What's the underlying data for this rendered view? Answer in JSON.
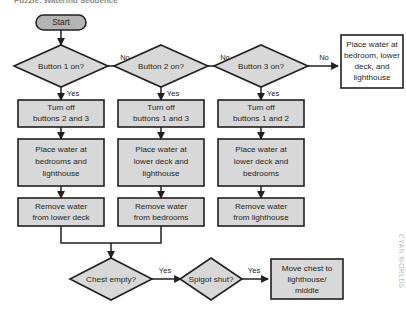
{
  "diagram": {
    "title_fragment": "Puzzle: Watering Sequence",
    "watermark": "CYAN WORLDS",
    "colors": {
      "node_fill": "#d8d8d8",
      "terminal_fill": "#b4b4b4",
      "alt_fill": "#ffffff",
      "stroke": "#231f20",
      "watermark": "#b9b9b9"
    },
    "start": {
      "label": "Start"
    },
    "decisions": [
      {
        "id": "button1",
        "label": "Button 1 on?",
        "yes_label": "Yes",
        "no_label": "No"
      },
      {
        "id": "button2",
        "label": "Button 2 on?",
        "yes_label": "Yes",
        "no_label": "No"
      },
      {
        "id": "button3",
        "label": "Button 3 on?",
        "yes_label": "Yes",
        "no_label": "No"
      },
      {
        "id": "chest",
        "label": "Chest empty?",
        "yes_label": "Yes"
      },
      {
        "id": "spigot",
        "label": "Spigot shut?",
        "yes_label": "Yes"
      }
    ],
    "columns": [
      {
        "id": "column-1",
        "steps": [
          {
            "line1": "Turn off",
            "line2": "buttons 2 and 3",
            "line3": ""
          },
          {
            "line1": "Place water at",
            "line2": "bedrooms and",
            "line3": "lighthouse"
          },
          {
            "line1": "Remove water",
            "line2": "from lower deck",
            "line3": ""
          }
        ]
      },
      {
        "id": "column-2",
        "steps": [
          {
            "line1": "Turn off",
            "line2": "buttons 1 and 3",
            "line3": ""
          },
          {
            "line1": "Place water at",
            "line2": "lower deck and",
            "line3": "lighthouse"
          },
          {
            "line1": "Remove water",
            "line2": "from bedrooms",
            "line3": ""
          }
        ]
      },
      {
        "id": "column-3",
        "steps": [
          {
            "line1": "Turn off",
            "line2": "buttons 1 and 2",
            "line3": ""
          },
          {
            "line1": "Place water at",
            "line2": "lower deck and",
            "line3": "bedrooms"
          },
          {
            "line1": "Remove water",
            "line2": "from lighthouse",
            "line3": ""
          }
        ]
      }
    ],
    "outcome_box": {
      "line1": "Place water at",
      "line2": "bedroom, lower",
      "line3": "deck, and",
      "line4": "lighthouse"
    },
    "final_box": {
      "line1": "Move chest to",
      "line2": "lighthouse/",
      "line3": "middle"
    }
  }
}
